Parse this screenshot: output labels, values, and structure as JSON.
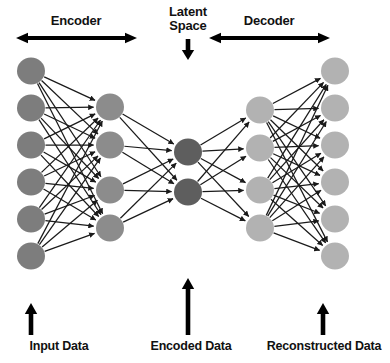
{
  "figure": {
    "background_color": "#ffffff"
  },
  "top_labels": {
    "encoder": "Encoder",
    "latent_space": "Latent\nSpace",
    "latent_space_line1": "Latent",
    "latent_space_line2": "Space",
    "decoder": "Decoder"
  },
  "bottom_labels": {
    "input_data": "Input Data",
    "encoded_data": "Encoded Data",
    "reconstructed_data": "Reconstructed Data"
  },
  "colors": {
    "input_node": "#7d7d7d",
    "encoder_hidden_node": "#8c8c8c",
    "latent_node": "#5e5e5e",
    "decoder_hidden_node": "#b2b2b2",
    "output_node": "#b2b2b2",
    "edge": "#1a1a1a",
    "arrow": "#000000",
    "text": "#111111"
  },
  "geometry": {
    "width": 390,
    "height": 363,
    "node_rx": 14,
    "node_ry": 13.5
  },
  "network": {
    "layers": [
      {
        "id": "input",
        "name": "Input Layer",
        "node_count": 6,
        "cx": 31,
        "color": "#7d7d7d",
        "cys": [
          71,
          108,
          145,
          182,
          219,
          256
        ]
      },
      {
        "id": "encoder_hidden",
        "name": "Encoder Hidden Layer",
        "node_count": 4,
        "cx": 110,
        "color": "#8c8c8c",
        "cys": [
          107,
          145,
          190,
          228
        ]
      },
      {
        "id": "latent",
        "name": "Latent Bottleneck Layer",
        "node_count": 2,
        "cx": 188,
        "color": "#5e5e5e",
        "cys": [
          152,
          192
        ]
      },
      {
        "id": "decoder_hidden",
        "name": "Decoder Hidden Layer",
        "node_count": 4,
        "cx": 260,
        "color": "#b2b2b2",
        "cys": [
          110,
          148,
          190,
          228
        ]
      },
      {
        "id": "output",
        "name": "Output Layer",
        "node_count": 6,
        "cx": 335,
        "color": "#b2b2b2",
        "cys": [
          71,
          108,
          145,
          182,
          219,
          256
        ]
      }
    ],
    "connection_groups": [
      {
        "from": "input",
        "to": "encoder_hidden"
      },
      {
        "from": "encoder_hidden",
        "to": "latent"
      },
      {
        "from": "latent",
        "to": "decoder_hidden"
      },
      {
        "from": "decoder_hidden",
        "to": "output"
      }
    ]
  },
  "annotation_arrows": [
    {
      "id": "encoder-span-arrow",
      "type": "double-horizontal",
      "x1": 16,
      "x2": 137,
      "y": 38
    },
    {
      "id": "latent-down-arrow",
      "type": "down",
      "x": 188,
      "y1": 39,
      "y2": 60
    },
    {
      "id": "decoder-span-arrow",
      "type": "double-horizontal",
      "x1": 209,
      "x2": 330,
      "y": 38
    },
    {
      "id": "input-data-up-arrow",
      "type": "up",
      "x": 31,
      "y1": 335,
      "y2": 303
    },
    {
      "id": "encoded-data-up-arrow",
      "type": "up",
      "x": 188,
      "y1": 335,
      "y2": 278
    },
    {
      "id": "reconstructed-data-up-arrow",
      "type": "up",
      "x": 323,
      "y1": 335,
      "y2": 303
    }
  ]
}
